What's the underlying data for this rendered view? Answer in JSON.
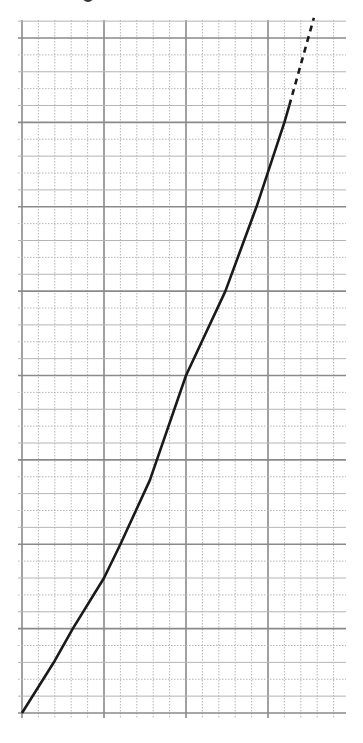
{
  "chart_data": {
    "type": "line",
    "title": "",
    "xlabel": "",
    "ylabel": "",
    "xlim": [
      0,
      19.7
    ],
    "ylim": [
      0,
      41
    ],
    "grid": {
      "on": true,
      "minor_step_x": 1,
      "minor_step_y": 1,
      "major_every_x": 5,
      "major_every_y": 5,
      "minor_style_x": "dotted",
      "minor_style_y": "alternating dotted / light solid",
      "major_style": "solid dark gray"
    },
    "tick_labels": {
      "x": [],
      "y": []
    },
    "legend": null,
    "series": [
      {
        "name": "measured",
        "style": "solid",
        "color": "#1a1a1a",
        "points": [
          [
            0,
            0
          ],
          [
            2.0,
            3.1
          ],
          [
            3.1,
            5.0
          ],
          [
            5.0,
            8.0
          ],
          [
            6.0,
            10.0
          ],
          [
            7.8,
            13.8
          ],
          [
            10.0,
            20.0
          ],
          [
            12.4,
            25.0
          ],
          [
            14.3,
            30.0
          ],
          [
            16.0,
            35.0
          ],
          [
            16.3,
            36.0
          ]
        ]
      },
      {
        "name": "extrapolated",
        "style": "dashed",
        "color": "#1a1a1a",
        "points": [
          [
            16.3,
            36.0
          ],
          [
            17.8,
            41.2
          ]
        ]
      }
    ],
    "annotations": []
  },
  "colors": {
    "background": "#ffffff",
    "major_grid": "#8a8a8a",
    "minor_grid": "#b5b5b5",
    "curve": "#1a1a1a"
  }
}
